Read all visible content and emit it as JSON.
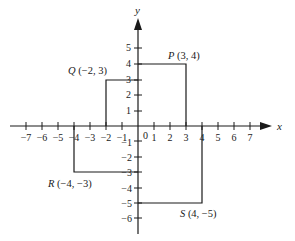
{
  "axes": {
    "x_label": "x",
    "y_label": "y",
    "origin_label": "0",
    "x_ticks": [
      "−7",
      "−6",
      "−5",
      "−4",
      "−3",
      "−2",
      "−1",
      "1",
      "2",
      "3",
      "4",
      "5",
      "6",
      "7"
    ],
    "y_ticks_pos": [
      "1",
      "2",
      "3",
      "4",
      "5"
    ],
    "y_ticks_neg": [
      "−1",
      "−2",
      "−3",
      "−4",
      "−5",
      "−6"
    ]
  },
  "points": {
    "P": {
      "name": "P",
      "coords": "(3, 4)",
      "x": 3,
      "y": 4
    },
    "Q": {
      "name": "Q",
      "coords": "(−2, 3)",
      "x": -2,
      "y": 3
    },
    "R": {
      "name": "R",
      "coords": "(−4, −3)",
      "x": -4,
      "y": -3
    },
    "S": {
      "name": "S",
      "coords": "(4, −5)",
      "x": 4,
      "y": -5
    }
  },
  "colors": {
    "ink": "#1a1a1a",
    "background": "#ffffff"
  }
}
